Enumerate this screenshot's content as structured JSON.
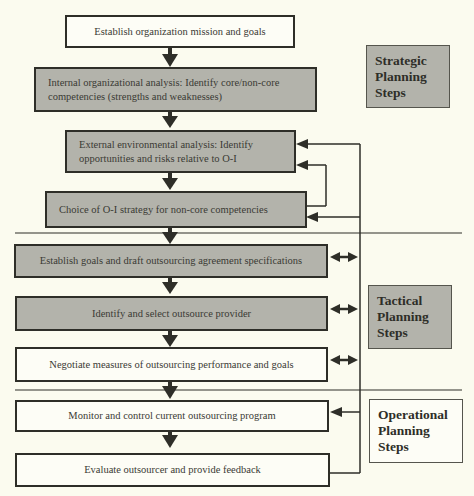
{
  "diagram": {
    "steps": [
      {
        "id": "s1",
        "text": "Establish organization mission and goals",
        "fill": "white"
      },
      {
        "id": "s2",
        "text": "Internal organizational analysis: Identify core/non-core competencies (strengths and weaknesses)",
        "fill": "gray"
      },
      {
        "id": "s3",
        "text": "External environmental analysis: Identify opportunities and risks relative to O-I",
        "fill": "gray"
      },
      {
        "id": "s4",
        "text": "Choice of O-I strategy for non-core competencies",
        "fill": "gray"
      },
      {
        "id": "s5",
        "text": "Establish goals and draft outsourcing agreement specifications",
        "fill": "gray"
      },
      {
        "id": "s6",
        "text": "Identify and select outsource provider",
        "fill": "gray"
      },
      {
        "id": "s7",
        "text": "Negotiate measures of outsourcing performance and goals",
        "fill": "white"
      },
      {
        "id": "s8",
        "text": "Monitor and control current outsourcing program",
        "fill": "white"
      },
      {
        "id": "s9",
        "text": "Evaluate outsourcer and provide feedback",
        "fill": "white"
      }
    ],
    "phases": [
      {
        "id": "strategic",
        "label_lines": [
          "Strategic",
          "Planning",
          "Steps"
        ],
        "fill": "gray"
      },
      {
        "id": "tactical",
        "label_lines": [
          "Tactical",
          "Planning",
          "Steps"
        ],
        "fill": "gray"
      },
      {
        "id": "operational",
        "label_lines": [
          "Operational",
          "Planning",
          "Steps"
        ],
        "fill": "white"
      }
    ],
    "colors": {
      "background": "#fbfbef",
      "box_gray": "#b3b3ab",
      "box_white": "#fdfdf6",
      "line": "#2e2e28"
    }
  }
}
